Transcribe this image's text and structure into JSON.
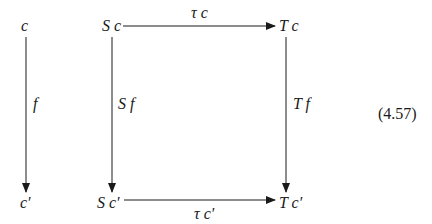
{
  "diagram": {
    "type": "commutative-square",
    "equation_number": "(4.57)",
    "objects": {
      "c": "c",
      "c_prime": "c′",
      "Sc": "S c",
      "Tc": "T c",
      "Sc_prime": "S c′",
      "Tc_prime": "T c′"
    },
    "morphisms": {
      "f": "f",
      "Sf": "S f",
      "Tf": "T f",
      "tau_c": "τ c",
      "tau_c_prime": "τ c′"
    },
    "edges": [
      {
        "from": "c",
        "to": "c′",
        "label": "f"
      },
      {
        "from": "S c",
        "to": "T c",
        "label": "τ c"
      },
      {
        "from": "S c",
        "to": "S c′",
        "label": "S f"
      },
      {
        "from": "T c",
        "to": "T c′",
        "label": "T f"
      },
      {
        "from": "S c′",
        "to": "T c′",
        "label": "τ c′"
      }
    ],
    "colors": {
      "ink": "#1a1a1a",
      "background": "#ffffff"
    }
  }
}
